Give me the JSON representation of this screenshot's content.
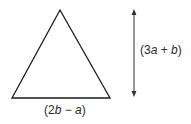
{
  "diagram": {
    "shape": "isosceles-triangle",
    "height_label": {
      "open": "(3",
      "var1": "a",
      "op": " + ",
      "var2": "b",
      "close": ")"
    },
    "base_label": {
      "open": "(2",
      "var1": "b",
      "op": " − ",
      "var2": "a",
      "close": ")"
    },
    "line_color": "#1a1a1a",
    "arrow_color": "#333333"
  }
}
